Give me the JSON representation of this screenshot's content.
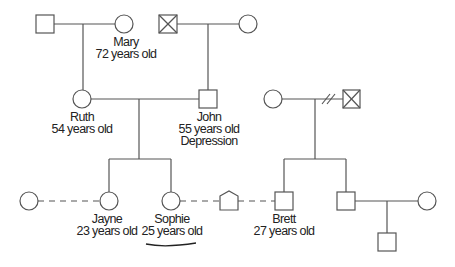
{
  "diagram": {
    "type": "family pedigree (genogram)",
    "colors": {
      "stroke": "#555555",
      "text": "#222222",
      "background": "#ffffff",
      "underline": "#222222"
    },
    "people": {
      "gf_maternal": {
        "shape": "square",
        "deceased": false
      },
      "mary": {
        "shape": "circle",
        "name": "Mary",
        "age": "72 years old"
      },
      "gf_paternal": {
        "shape": "square",
        "deceased": true
      },
      "gm_paternal": {
        "shape": "circle"
      },
      "ruth": {
        "shape": "circle",
        "name": "Ruth",
        "age": "54 years old"
      },
      "john": {
        "shape": "square",
        "name": "John",
        "age": "55 years old",
        "condition": "Depression"
      },
      "brett_mother": {
        "shape": "circle"
      },
      "brett_father": {
        "shape": "square",
        "deceased": true,
        "relationship": "divorced"
      },
      "jayne_partner": {
        "shape": "circle",
        "relationship": "dashed (unmarried)"
      },
      "jayne": {
        "shape": "circle",
        "name": "Jayne",
        "age": "23 years old"
      },
      "sophie": {
        "shape": "circle",
        "name": "Sophie",
        "age": "25 years old",
        "highlighted": true
      },
      "pet": {
        "shape": "pentagon (house/pet)"
      },
      "brett": {
        "shape": "square",
        "name": "Brett",
        "age": "27 years old"
      },
      "brett_brother": {
        "shape": "square"
      },
      "brother_wife": {
        "shape": "circle"
      },
      "brother_son": {
        "shape": "square"
      }
    }
  }
}
